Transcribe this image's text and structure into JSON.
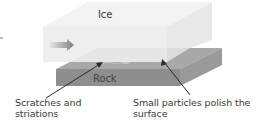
{
  "diagram": {
    "labels": {
      "ice": "Ice",
      "rock": "Rock",
      "scratches_line1": "Scratches and",
      "scratches_line2": "striations",
      "particles_line1": "Small particles polish the",
      "particles_line2": "surface"
    },
    "icons": {
      "flow_arrow": "arrow-right-icon"
    },
    "colors": {
      "ice_top": "#f2f2f2",
      "ice_front": "#ebebeb",
      "rock_top": "#a9a9a9",
      "rock_front": "#8f8f8f",
      "rock_side": "#9c9c9c",
      "arrow": "#8a8a8a",
      "leader": "#2b2b2b"
    }
  }
}
